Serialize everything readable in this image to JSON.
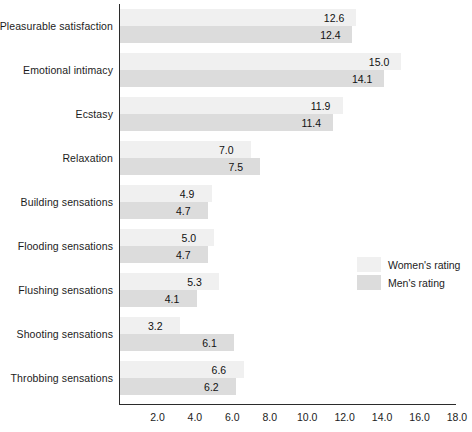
{
  "chart_data": {
    "type": "bar",
    "orientation": "horizontal",
    "title": "",
    "xlabel": "",
    "ylabel": "",
    "xlim": [
      0,
      18.8
    ],
    "xticks": [
      "2.0",
      "4.0",
      "6.0",
      "8.0",
      "10.0",
      "12.0",
      "14.0",
      "16.0",
      "18.0"
    ],
    "xtick_values": [
      2.0,
      4.0,
      6.0,
      8.0,
      10.0,
      12.0,
      14.0,
      16.0,
      18.0
    ],
    "grid": false,
    "legend_position": "right-middle",
    "categories": [
      "Pleasurable satisfaction",
      "Emotional intimacy",
      "Ecstasy",
      "Relaxation",
      "Building sensations",
      "Flooding sensations",
      "Flushing sensations",
      "Shooting sensations",
      "Throbbing sensations"
    ],
    "series": [
      {
        "name": "Women's rating",
        "color": "#f0f0f0",
        "values": [
          12.6,
          15.0,
          11.9,
          7.0,
          4.9,
          5.0,
          5.3,
          3.2,
          6.6
        ],
        "labels": [
          "12.6",
          "15.0",
          "11.9",
          "7.0",
          "4.9",
          "5.0",
          "5.3",
          "3.2",
          "6.6"
        ]
      },
      {
        "name": "Men's rating",
        "color": "#dcdcdc",
        "values": [
          12.4,
          14.1,
          11.4,
          7.5,
          4.7,
          4.7,
          4.1,
          6.1,
          6.2
        ],
        "labels": [
          "12.4",
          "14.1",
          "11.4",
          "7.5",
          "4.7",
          "4.7",
          "4.1",
          "6.1",
          "6.2"
        ]
      }
    ]
  },
  "legend": {
    "items": [
      {
        "label": "Women's rating",
        "color": "#f0f0f0"
      },
      {
        "label": "Men's rating",
        "color": "#dcdcdc"
      }
    ]
  },
  "axis": {
    "line_color": "#2b2b2b"
  }
}
